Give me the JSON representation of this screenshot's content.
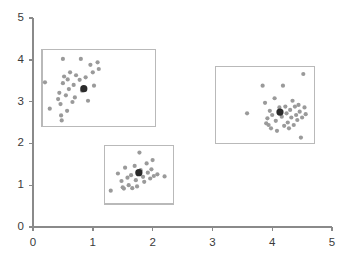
{
  "chart_data": {
    "type": "scatter",
    "title": "",
    "subtitle": "",
    "xlabel": "",
    "ylabel": "",
    "xlim": [
      0,
      5
    ],
    "ylim": [
      0,
      5
    ],
    "xticks": [
      0,
      1,
      2,
      3,
      4,
      5
    ],
    "yticks": [
      0,
      1,
      2,
      3,
      4,
      5
    ],
    "xtick_labels": [
      "0",
      "1",
      "2",
      "3",
      "4",
      "5"
    ],
    "ytick_labels": [
      "0",
      "1",
      "2",
      "3",
      "4",
      "5"
    ],
    "grid": false,
    "legend": null,
    "legend_position": "none",
    "colors": {
      "point": "#9a9a9a",
      "centroid": "#2b2b2b",
      "box": "#b9b9b9",
      "axis": "#8a8a8a",
      "background": "#ffffff",
      "tick_label": "#3a3a3a"
    },
    "point_radius": 2.1,
    "centroid_radius": 3.6,
    "annotations": [],
    "series": [
      {
        "name": "cluster-1",
        "centroid": [
          0.85,
          3.31
        ],
        "bounding_box": {
          "x0": 0.15,
          "y0": 2.4,
          "x1": 2.05,
          "y1": 4.25
        },
        "points": [
          [
            0.2,
            3.46
          ],
          [
            0.28,
            2.83
          ],
          [
            0.42,
            3.06
          ],
          [
            0.44,
            3.21
          ],
          [
            0.46,
            2.94
          ],
          [
            0.47,
            2.67
          ],
          [
            0.48,
            2.55
          ],
          [
            0.5,
            3.44
          ],
          [
            0.5,
            4.02
          ],
          [
            0.52,
            3.6
          ],
          [
            0.55,
            3.15
          ],
          [
            0.57,
            2.78
          ],
          [
            0.58,
            3.53
          ],
          [
            0.6,
            3.3
          ],
          [
            0.62,
            3.7
          ],
          [
            0.66,
            2.99
          ],
          [
            0.68,
            3.4
          ],
          [
            0.7,
            3.1
          ],
          [
            0.72,
            3.63
          ],
          [
            0.78,
            3.52
          ],
          [
            0.8,
            4.02
          ],
          [
            0.82,
            3.26
          ],
          [
            0.88,
            3.58
          ],
          [
            0.92,
            3.02
          ],
          [
            0.96,
            3.88
          ],
          [
            1.0,
            3.7
          ],
          [
            1.02,
            3.38
          ],
          [
            1.08,
            3.94
          ],
          [
            1.1,
            3.78
          ]
        ]
      },
      {
        "name": "cluster-2",
        "centroid": [
          1.77,
          1.3
        ],
        "bounding_box": {
          "x0": 1.2,
          "y0": 0.55,
          "x1": 2.35,
          "y1": 1.95
        },
        "points": [
          [
            1.3,
            0.87
          ],
          [
            1.42,
            1.28
          ],
          [
            1.48,
            1.1
          ],
          [
            1.5,
            0.95
          ],
          [
            1.52,
            0.92
          ],
          [
            1.54,
            1.42
          ],
          [
            1.58,
            1.18
          ],
          [
            1.6,
            1.0
          ],
          [
            1.64,
            1.24
          ],
          [
            1.66,
            0.93
          ],
          [
            1.7,
            1.46
          ],
          [
            1.72,
            1.12
          ],
          [
            1.74,
            0.97
          ],
          [
            1.78,
            1.78
          ],
          [
            1.8,
            1.36
          ],
          [
            1.84,
            1.2
          ],
          [
            1.86,
            1.08
          ],
          [
            1.9,
            1.52
          ],
          [
            1.92,
            1.3
          ],
          [
            1.96,
            1.16
          ],
          [
            1.98,
            1.38
          ],
          [
            2.0,
            1.6
          ],
          [
            2.02,
            1.22
          ],
          [
            2.08,
            1.26
          ],
          [
            2.2,
            1.21
          ]
        ]
      },
      {
        "name": "cluster-3",
        "centroid": [
          4.13,
          2.75
        ],
        "bounding_box": {
          "x0": 3.05,
          "y0": 2.0,
          "x1": 4.7,
          "y1": 3.85
        },
        "points": [
          [
            3.58,
            2.72
          ],
          [
            3.84,
            3.38
          ],
          [
            3.88,
            2.97
          ],
          [
            3.9,
            2.48
          ],
          [
            3.92,
            2.6
          ],
          [
            3.94,
            2.44
          ],
          [
            3.96,
            2.78
          ],
          [
            3.98,
            2.36
          ],
          [
            4.0,
            2.68
          ],
          [
            4.04,
            3.08
          ],
          [
            4.06,
            2.54
          ],
          [
            4.08,
            2.3
          ],
          [
            4.12,
            2.86
          ],
          [
            4.16,
            2.64
          ],
          [
            4.18,
            3.38
          ],
          [
            4.2,
            2.42
          ],
          [
            4.22,
            2.88
          ],
          [
            4.24,
            2.72
          ],
          [
            4.26,
            2.5
          ],
          [
            4.28,
            2.36
          ],
          [
            4.3,
            2.8
          ],
          [
            4.32,
            2.62
          ],
          [
            4.34,
            3.02
          ],
          [
            4.36,
            2.44
          ],
          [
            4.38,
            2.88
          ],
          [
            4.4,
            2.68
          ],
          [
            4.42,
            2.56
          ],
          [
            4.44,
            2.92
          ],
          [
            4.46,
            2.76
          ],
          [
            4.48,
            2.14
          ],
          [
            4.5,
            2.62
          ],
          [
            4.52,
            3.66
          ],
          [
            4.54,
            2.86
          ],
          [
            4.56,
            2.7
          ]
        ]
      }
    ]
  }
}
